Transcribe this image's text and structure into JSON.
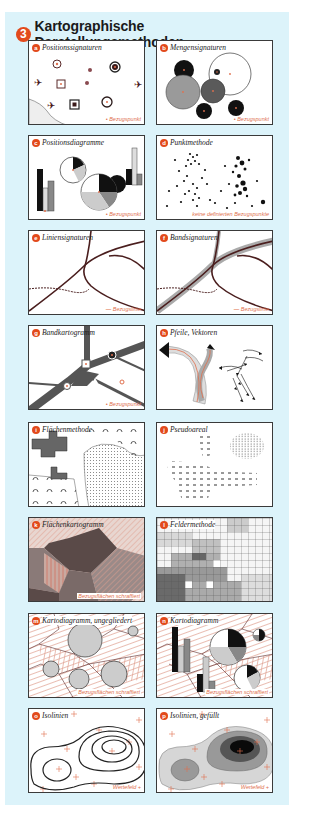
{
  "figure": {
    "number": "3",
    "title": "Kartographische Darstellungsmethoden",
    "accent_color": "#e24a1c",
    "background_color": "#dcf3fa",
    "reference_color": "#e0704e"
  },
  "panels": [
    {
      "id": "a",
      "title": "Positionssignaturen",
      "caption": "• Bezugspunkt"
    },
    {
      "id": "b",
      "title": "Mengensignaturen",
      "caption": "• Bezugspunkt"
    },
    {
      "id": "c",
      "title": "Positionsdiagramme",
      "caption": "• Bezugspunkt"
    },
    {
      "id": "d",
      "title": "Punktmethode",
      "caption": "keine definierten Bezugspunkte"
    },
    {
      "id": "e",
      "title": "Liniensignaturen",
      "caption": "— Bezugslinie"
    },
    {
      "id": "f",
      "title": "Bandsignaturen",
      "caption": "— Bezugslinie"
    },
    {
      "id": "g",
      "title": "Bandkartogramm",
      "caption": "• Bezugspunkt"
    },
    {
      "id": "h",
      "title": "Pfeile, Vektoren",
      "caption": ""
    },
    {
      "id": "i",
      "title": "Flächenmethode",
      "caption": ""
    },
    {
      "id": "j",
      "title": "Pseudoareal",
      "caption": ""
    },
    {
      "id": "k",
      "title": "Flächenkartogramm",
      "caption": "Bezugsflächen schraffiert"
    },
    {
      "id": "l",
      "title": "Feldermethode",
      "caption": ""
    },
    {
      "id": "m",
      "title": "Kartodiagramm, ungegliedert",
      "caption": "Bezugsflächen schraffiert"
    },
    {
      "id": "n",
      "title": "Kartodiagramm",
      "caption": "Bezugsflächen schraffiert"
    },
    {
      "id": "o",
      "title": "Isolinien",
      "caption": "Wertefeld +"
    },
    {
      "id": "p",
      "title": "Isolinien, gefüllt",
      "caption": "Wertefeld +"
    }
  ]
}
